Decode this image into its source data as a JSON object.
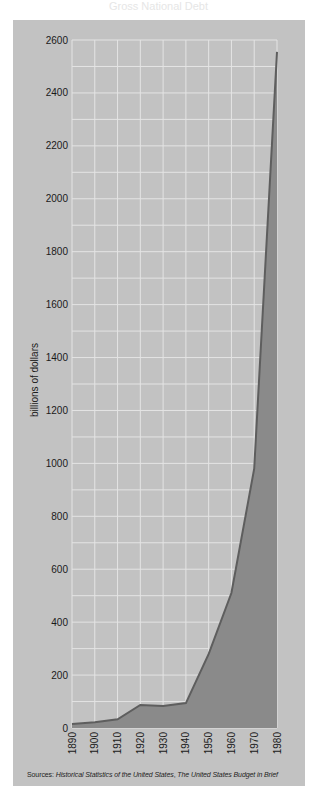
{
  "title": "Gross National Debt",
  "colors": {
    "card_background": "#c2c2c2",
    "grid": "#e4e4e4",
    "area_fill": "#8a8a8a",
    "line": "#5e5e5e",
    "text": "#1a1a1a"
  },
  "y_axis": {
    "label": "billions of dollars",
    "ticks": [
      "0",
      "200",
      "400",
      "600",
      "800",
      "1000",
      "1200",
      "1400",
      "1600",
      "1800",
      "2000",
      "2200",
      "2400",
      "2600"
    ]
  },
  "x_axis": {
    "ticks": [
      "1890",
      "1900",
      "1910",
      "1920",
      "1930",
      "1940",
      "1950",
      "1960",
      "1970",
      "1980"
    ]
  },
  "sources": {
    "prefix": "Sources: ",
    "source1": "Historical Statistics of the United States",
    "separator": ", ",
    "source2": "The United States Budget in Brief"
  },
  "chart_data": {
    "type": "area",
    "title": "",
    "xlabel": "",
    "ylabel": "billions of dollars",
    "x": [
      1890,
      1900,
      1910,
      1920,
      1930,
      1940,
      1950,
      1960,
      1970,
      1980
    ],
    "values": [
      15,
      22,
      33,
      87,
      83,
      94,
      280,
      510,
      980,
      2555
    ],
    "ylim": [
      0,
      2600
    ],
    "xlim": [
      1890,
      1980
    ],
    "y_ticks": [
      0,
      200,
      400,
      600,
      800,
      1000,
      1200,
      1400,
      1600,
      1800,
      2000,
      2200,
      2400,
      2600
    ],
    "grid": true,
    "grid_y_step": 100,
    "grid_x_step": 10,
    "legend": null,
    "annotations": [
      "Sources: Historical Statistics of the United States, The United States Budget in Brief"
    ]
  }
}
